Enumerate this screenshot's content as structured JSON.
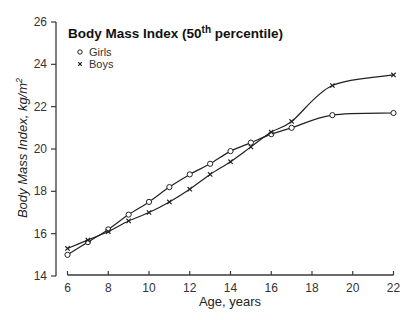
{
  "chart_data": {
    "type": "line",
    "title": "Body Mass Index (50th percentile)",
    "title_parts": {
      "before": "Body Mass Index (50",
      "sup": "th",
      "after": " percentile)"
    },
    "xlabel": "Age, years",
    "ylabel": "Body Mass Index, kg/m²",
    "ylabel_parts": {
      "main": "Body Mass Index, kg/m",
      "sup": "2"
    },
    "xlim": [
      6,
      22
    ],
    "ylim": [
      14,
      26
    ],
    "xticks": [
      6,
      8,
      10,
      12,
      14,
      16,
      18,
      20,
      22
    ],
    "yticks": [
      14,
      16,
      18,
      20,
      22,
      24,
      26
    ],
    "grid": false,
    "legend_position": "upper-left",
    "series": [
      {
        "name": "Girls",
        "marker": "circle",
        "x": [
          6,
          7,
          8,
          9,
          10,
          11,
          12,
          13,
          14,
          15,
          16,
          17,
          19,
          22
        ],
        "values": [
          15.0,
          15.6,
          16.2,
          16.9,
          17.5,
          18.2,
          18.8,
          19.3,
          19.9,
          20.3,
          20.7,
          21.0,
          21.6,
          21.7
        ]
      },
      {
        "name": "Boys",
        "marker": "x",
        "x": [
          6,
          7,
          8,
          9,
          10,
          11,
          12,
          13,
          14,
          15,
          16,
          17,
          19,
          22
        ],
        "values": [
          15.3,
          15.7,
          16.1,
          16.6,
          17.0,
          17.5,
          18.1,
          18.8,
          19.4,
          20.1,
          20.8,
          21.3,
          23.0,
          23.5
        ]
      }
    ]
  }
}
